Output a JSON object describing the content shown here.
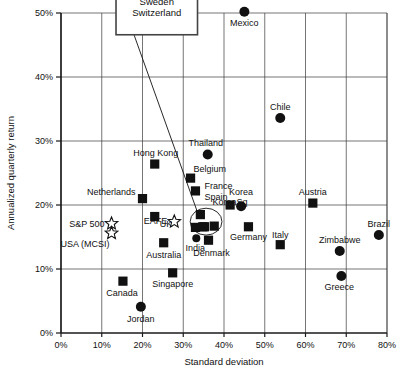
{
  "chart_data": {
    "type": "scatter",
    "title": "",
    "xlabel": "Standard deviation",
    "ylabel": "Annualized quarterly return",
    "xlim": [
      0,
      80
    ],
    "ylim": [
      0,
      50
    ],
    "xticks": [
      "0%",
      "10%",
      "20%",
      "30%",
      "40%",
      "50%",
      "60%",
      "70%",
      "80%"
    ],
    "yticks": [
      "0%",
      "10%",
      "20%",
      "30%",
      "40%",
      "50%"
    ],
    "xtick_values": [
      0,
      10,
      20,
      30,
      40,
      50,
      60,
      70,
      80
    ],
    "ytick_values": [
      0,
      10,
      20,
      30,
      40,
      50
    ],
    "grid": true,
    "legend": "none",
    "marker_types": [
      "square",
      "circle",
      "star"
    ],
    "points": [
      {
        "name": "Mexico",
        "x": 45.0,
        "y": 50.2,
        "marker": "circle",
        "label_dx": 0,
        "label_dy": 14,
        "anchor": "middle"
      },
      {
        "name": "Chile",
        "x": 53.8,
        "y": 33.6,
        "marker": "circle",
        "label_dx": 0,
        "label_dy": -8,
        "anchor": "middle"
      },
      {
        "name": "Thailand",
        "x": 36.0,
        "y": 27.9,
        "marker": "circle",
        "label_dx": -2,
        "label_dy": -8,
        "anchor": "middle"
      },
      {
        "name": "Hong Kong",
        "x": 23.0,
        "y": 26.4,
        "marker": "square",
        "label_dx": 1,
        "label_dy": -8,
        "anchor": "middle"
      },
      {
        "name": "Belgium",
        "x": 31.8,
        "y": 24.2,
        "marker": "square",
        "label_dx": 3,
        "label_dy": -6,
        "anchor": "start"
      },
      {
        "name": "France",
        "x": 33.0,
        "y": 22.2,
        "marker": "square",
        "label_dx": 9,
        "label_dy": -2,
        "anchor": "start"
      },
      {
        "name": "Spain",
        "x": 33.0,
        "y": 22.2,
        "marker": "none",
        "label_dx": 9,
        "label_dy": 9,
        "anchor": "start"
      },
      {
        "name": "Netherlands",
        "x": 20.0,
        "y": 21.0,
        "marker": "square",
        "label_dx": -7,
        "label_dy": -4,
        "anchor": "end"
      },
      {
        "name": "Austria",
        "x": 61.8,
        "y": 20.3,
        "marker": "square",
        "label_dx": 0,
        "label_dy": -8,
        "anchor": "middle"
      },
      {
        "name": "Korea",
        "x": 44.2,
        "y": 19.8,
        "marker": "circle",
        "label_dx": 0,
        "label_dy": -11,
        "anchor": "middle"
      },
      {
        "name": "KoreaSq",
        "x": 41.5,
        "y": 20.0,
        "marker": "square",
        "label_dx": 0,
        "label_dy": 0,
        "anchor": "middle"
      },
      {
        "name": "UK",
        "x": 23.0,
        "y": 18.2,
        "marker": "square",
        "label_dx": 5,
        "label_dy": 10,
        "anchor": "start"
      },
      {
        "name": "EAFE",
        "x": 27.8,
        "y": 17.4,
        "marker": "star",
        "label_dx": -7,
        "label_dy": 2,
        "anchor": "end"
      },
      {
        "name": "S&P 500",
        "x": 12.4,
        "y": 17.1,
        "marker": "star",
        "label_dx": -7,
        "label_dy": 3,
        "anchor": "end"
      },
      {
        "name": "USA (MCSI)",
        "x": 12.4,
        "y": 15.6,
        "marker": "star",
        "label_dx": -2,
        "label_dy": 14,
        "anchor": "end"
      },
      {
        "name": "Brazil",
        "x": 78.0,
        "y": 15.3,
        "marker": "circle",
        "label_dx": 0,
        "label_dy": -8,
        "anchor": "middle"
      },
      {
        "name": "Germany",
        "x": 46.0,
        "y": 16.6,
        "marker": "square",
        "label_dx": 0,
        "label_dy": 13,
        "anchor": "middle"
      },
      {
        "name": "Italy",
        "x": 53.8,
        "y": 13.8,
        "marker": "square",
        "label_dx": 0,
        "label_dy": -7,
        "anchor": "middle"
      },
      {
        "name": "Zimbabwe",
        "x": 68.4,
        "y": 12.8,
        "marker": "circle",
        "label_dx": 0,
        "label_dy": -8,
        "anchor": "middle"
      },
      {
        "name": "India",
        "x": 33.2,
        "y": 14.8,
        "marker": "circle",
        "label_dx": -1,
        "label_dy": 13,
        "anchor": "middle"
      },
      {
        "name": "Denmark",
        "x": 36.2,
        "y": 14.5,
        "marker": "square",
        "label_dx": 3,
        "label_dy": 16,
        "anchor": "middle"
      },
      {
        "name": "Australia",
        "x": 25.2,
        "y": 14.1,
        "marker": "square",
        "label_dx": 0,
        "label_dy": 15,
        "anchor": "middle"
      },
      {
        "name": "Singapore",
        "x": 27.4,
        "y": 9.4,
        "marker": "square",
        "label_dx": 0,
        "label_dy": 14,
        "anchor": "middle"
      },
      {
        "name": "Greece",
        "x": 68.8,
        "y": 8.9,
        "marker": "circle",
        "label_dx": -2,
        "label_dy": 14,
        "anchor": "middle"
      },
      {
        "name": "Canada",
        "x": 15.2,
        "y": 8.1,
        "marker": "square",
        "label_dx": -1,
        "label_dy": 15,
        "anchor": "middle"
      },
      {
        "name": "Jordan",
        "x": 19.6,
        "y": 4.1,
        "marker": "circle",
        "label_dx": 0,
        "label_dy": 15,
        "anchor": "middle"
      }
    ],
    "cluster_points": [
      {
        "x": 34.2,
        "y": 18.5,
        "marker": "square"
      },
      {
        "x": 33.0,
        "y": 16.5,
        "marker": "square"
      },
      {
        "x": 35.2,
        "y": 16.6,
        "marker": "square"
      },
      {
        "x": 37.6,
        "y": 16.7,
        "marker": "square"
      },
      {
        "x": 34.8,
        "y": 16.6,
        "marker": "square"
      }
    ],
    "highlight_ellipse": {
      "cx": 35.6,
      "cy": 17.4,
      "rx": 3.9,
      "ry": 2.1
    },
    "callout": {
      "lines": [
        "Japan",
        "Norway",
        "Sweden",
        "Switzerland"
      ],
      "box_x": 13.5,
      "box_y": 46.6,
      "box_w": 20.0,
      "box_h": 10.5,
      "leader_to_x": 33.0,
      "leader_to_y": 18.0
    }
  }
}
